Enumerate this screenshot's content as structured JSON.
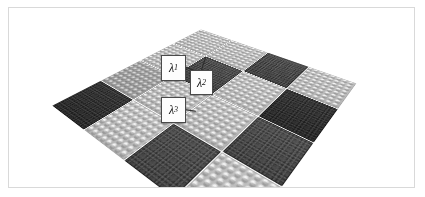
{
  "figure": {
    "frame": {
      "border_color": "#d9d9d9",
      "background_color": "#ffffff"
    },
    "scene": {
      "description": "Perspective view of a checkerboard array of modular baseplate tiles",
      "grid_rows": 4,
      "grid_cols": 4,
      "tile_types": [
        "light-studded-plate",
        "dark-textured-plate"
      ],
      "colors": {
        "light_tile": "#bdbdbd",
        "light_tile_mid": "#a0a0a0",
        "dark_tile": "#323232",
        "dark_tile_mid": "#4e4e4e",
        "leader_line": "#2a2a2a"
      },
      "pattern": [
        [
          "light",
          "light",
          "dark",
          "light"
        ],
        [
          "light",
          "dark",
          "light",
          "dark"
        ],
        [
          "light",
          "light",
          "light",
          "dark"
        ],
        [
          "dark",
          "light",
          "dark",
          "light"
        ]
      ]
    },
    "callouts": [
      {
        "name": "lambda-1",
        "base": "λ",
        "sub": "1",
        "x": 152,
        "y": 47,
        "w": 23,
        "h": 24
      },
      {
        "name": "lambda-2",
        "base": "λ",
        "sub": "2",
        "x": 181,
        "y": 62,
        "w": 21,
        "h": 23
      },
      {
        "name": "lambda-3",
        "base": "λ",
        "sub": "3",
        "x": 152,
        "y": 89,
        "w": 23,
        "h": 24
      }
    ]
  }
}
